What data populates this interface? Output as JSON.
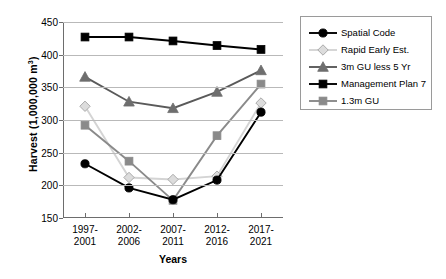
{
  "chart_data": {
    "type": "line",
    "title": "",
    "xlabel": "Years",
    "ylabel": "Harvest (1,000,000 m3)",
    "ylabel_main": "Harvest (1,000,000 m",
    "ylabel_sup": "3",
    "ylabel_close": ")",
    "categories": [
      "1997-\n2001",
      "2002-\n2006",
      "2007-\n2011",
      "2012-\n2016",
      "2017-\n2021"
    ],
    "categories_lines": [
      [
        "1997-",
        "2001"
      ],
      [
        "2002-",
        "2006"
      ],
      [
        "2007-",
        "2011"
      ],
      [
        "2012-",
        "2016"
      ],
      [
        "2017-",
        "2021"
      ]
    ],
    "ylim": [
      150,
      450
    ],
    "yticks": [
      450,
      400,
      350,
      300,
      250,
      200,
      150
    ],
    "grid": true,
    "legend_position": "right",
    "series": [
      {
        "name": "Spatial Code",
        "marker": "circle",
        "color": "#000000",
        "marker_color": "#000000",
        "values": [
          233,
          196,
          178,
          208,
          312
        ]
      },
      {
        "name": "Rapid Early Est.",
        "marker": "diamond",
        "color": "#d4d4d4",
        "marker_color": "#dcdcdc",
        "values": [
          321,
          212,
          209,
          214,
          326
        ]
      },
      {
        "name": "3m GU less 5 Yr",
        "marker": "triangle",
        "color": "#5a5a5a",
        "marker_color": "#6e6e6e",
        "values": [
          366,
          328,
          318,
          343,
          376
        ]
      },
      {
        "name": "Management Plan 7",
        "marker": "square",
        "color": "#000000",
        "marker_color": "#000000",
        "values": [
          427,
          427,
          421,
          414,
          408
        ]
      },
      {
        "name": "1.3m GU",
        "marker": "square",
        "color": "#8a8a8a",
        "marker_color": "#8a8a8a",
        "values": [
          292,
          237,
          177,
          276,
          355
        ]
      }
    ]
  }
}
